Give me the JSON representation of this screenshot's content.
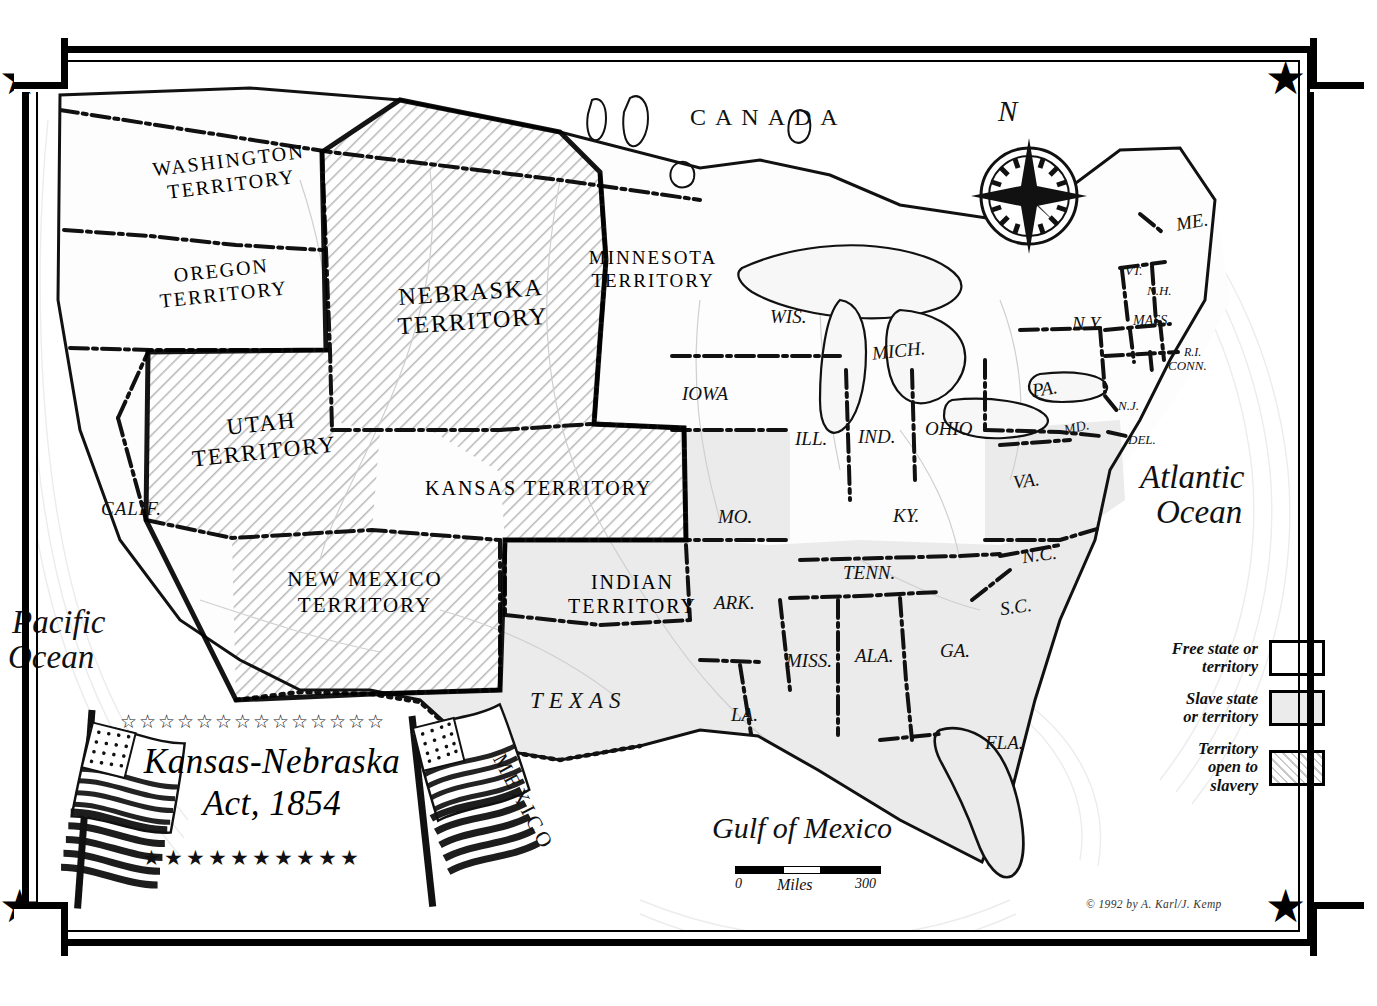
{
  "map": {
    "title_line1": "Kansas-Nebraska",
    "title_line2": "Act, 1854",
    "copyright": "© 1992 by A. Karl/J. Kemp",
    "compass_north": "N",
    "stars_top_count": 14,
    "stars_bottom_count": 10,
    "colors": {
      "free": "#ffffff",
      "slave": "#ebebeb",
      "open": "#dcdcdc",
      "ink": "#000000"
    }
  },
  "legend": {
    "items": [
      {
        "label_line1": "Free state or",
        "label_line2": "territory",
        "swatch": "free"
      },
      {
        "label_line1": "Slave state",
        "label_line2": "or territory",
        "swatch": "slave"
      },
      {
        "label_line1": "Territory",
        "label_line2": "open to",
        "label_line3": "slavery",
        "swatch": "open"
      }
    ]
  },
  "scale": {
    "min": "0",
    "unit": "Miles",
    "max": "300"
  },
  "water": {
    "pacific_line1": "Pacific",
    "pacific_line2": "Ocean",
    "atlantic_line1": "Atlantic",
    "atlantic_line2": "Ocean",
    "gulf": "Gulf of Mexico"
  },
  "countries": [
    {
      "name": "CANADA"
    },
    {
      "name": "MEXICO"
    }
  ],
  "territories": [
    {
      "line1": "WASHINGTON",
      "line2": "TERRITORY",
      "status": "free"
    },
    {
      "line1": "OREGON",
      "line2": "TERRITORY",
      "status": "free"
    },
    {
      "line1": "MINNESOTA",
      "line2": "TERRITORY",
      "status": "free"
    },
    {
      "line1": "NEBRASKA",
      "line2": "TERRITORY",
      "status": "open"
    },
    {
      "line1": "UTAH",
      "line2": "TERRITORY",
      "status": "open"
    },
    {
      "line1": "KANSAS TERRITORY",
      "line2": "",
      "status": "open"
    },
    {
      "line1": "NEW MEXICO",
      "line2": "TERRITORY",
      "status": "open"
    },
    {
      "line1": "INDIAN",
      "line2": "TERRITORY",
      "status": "slave"
    }
  ],
  "states": [
    {
      "name": "CALIF.",
      "status": "free"
    },
    {
      "name": "WIS.",
      "status": "free"
    },
    {
      "name": "MICH.",
      "status": "free"
    },
    {
      "name": "IOWA",
      "status": "free"
    },
    {
      "name": "ILL.",
      "status": "free"
    },
    {
      "name": "IND.",
      "status": "free"
    },
    {
      "name": "OHIO",
      "status": "free"
    },
    {
      "name": "PA.",
      "status": "free"
    },
    {
      "name": "N.Y.",
      "status": "free"
    },
    {
      "name": "ME.",
      "status": "free"
    },
    {
      "name": "VT.",
      "status": "free"
    },
    {
      "name": "N.H.",
      "status": "free"
    },
    {
      "name": "MASS.",
      "status": "free"
    },
    {
      "name": "R.I.",
      "status": "free"
    },
    {
      "name": "CONN.",
      "status": "free"
    },
    {
      "name": "N.J.",
      "status": "free"
    },
    {
      "name": "MO.",
      "status": "slave"
    },
    {
      "name": "KY.",
      "status": "slave"
    },
    {
      "name": "VA.",
      "status": "slave"
    },
    {
      "name": "MD.",
      "status": "slave"
    },
    {
      "name": "DEL.",
      "status": "slave"
    },
    {
      "name": "N.C.",
      "status": "slave"
    },
    {
      "name": "S.C.",
      "status": "slave"
    },
    {
      "name": "TENN.",
      "status": "slave"
    },
    {
      "name": "ARK.",
      "status": "slave"
    },
    {
      "name": "MISS.",
      "status": "slave"
    },
    {
      "name": "ALA.",
      "status": "slave"
    },
    {
      "name": "GA.",
      "status": "slave"
    },
    {
      "name": "FLA.",
      "status": "slave"
    },
    {
      "name": "LA.",
      "status": "slave"
    },
    {
      "name": "TEXAS",
      "status": "slave"
    }
  ]
}
